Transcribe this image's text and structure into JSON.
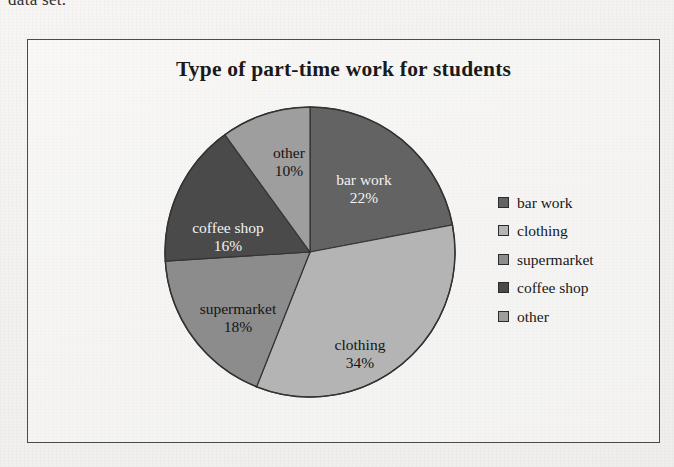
{
  "page": {
    "text_fragment": "data set.",
    "background_color": "#f4f3f1",
    "frame_border_color": "#4a4a4a"
  },
  "chart_data": {
    "type": "pie",
    "title": "Type of part-time work for students",
    "xlabel": "",
    "ylabel": "",
    "legend_position": "right",
    "grid": false,
    "start_angle_deg": 0,
    "direction": "clockwise",
    "categories": [
      "bar work",
      "clothing",
      "supermarket",
      "coffee shop",
      "other"
    ],
    "values": [
      22,
      34,
      18,
      16,
      10
    ],
    "value_unit": "%",
    "colors": [
      "#636363",
      "#b4b4b4",
      "#8c8c8c",
      "#4a4a4a",
      "#9e9e9e"
    ],
    "slices": [
      {
        "label": "bar work",
        "value": 22,
        "value_label": "22%",
        "color": "#636363",
        "label_color": "light",
        "label_x": 200,
        "label_y": 75
      },
      {
        "label": "clothing",
        "value": 34,
        "value_label": "34%",
        "color": "#b4b4b4",
        "label_color": "dark",
        "label_x": 196,
        "label_y": 240
      },
      {
        "label": "supermarket",
        "value": 18,
        "value_label": "18%",
        "color": "#8c8c8c",
        "label_color": "dark",
        "label_x": 74,
        "label_y": 204
      },
      {
        "label": "coffee shop",
        "value": 16,
        "value_label": "16%",
        "color": "#4a4a4a",
        "label_color": "light",
        "label_x": 64,
        "label_y": 123
      },
      {
        "label": "other",
        "value": 10,
        "value_label": "10%",
        "color": "#9e9e9e",
        "label_color": "dark",
        "label_x": 125,
        "label_y": 48
      }
    ],
    "legend": [
      {
        "label": "bar work",
        "color": "#636363"
      },
      {
        "label": "clothing",
        "color": "#b4b4b4"
      },
      {
        "label": "supermarket",
        "color": "#8c8c8c"
      },
      {
        "label": "coffee shop",
        "color": "#4a4a4a"
      },
      {
        "label": "other",
        "color": "#9e9e9e"
      }
    ]
  }
}
